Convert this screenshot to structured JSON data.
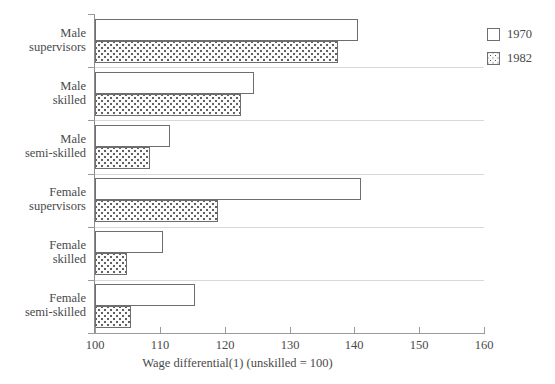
{
  "chart_data": {
    "type": "bar",
    "orientation": "horizontal",
    "title": "",
    "xlabel": "Wage differential(1) (unskilled = 100)",
    "ylabel": "",
    "xlim": [
      100,
      160
    ],
    "xticks": [
      100,
      110,
      120,
      130,
      140,
      150,
      160
    ],
    "xtick_labels": [
      "100",
      "110",
      "120",
      "130",
      "140",
      "150",
      "160"
    ],
    "grid": false,
    "legend_position": "right",
    "categories": [
      "Male\nsupervisors",
      "Male\nskilled",
      "Male\nsemi-skilled",
      "Female\nsupervisors",
      "Female\nskilled",
      "Female\nsemi-skilled"
    ],
    "series": [
      {
        "name": "1970",
        "values": [
          140.5,
          124.5,
          111.5,
          141.0,
          110.5,
          115.5
        ]
      },
      {
        "name": "1982",
        "values": [
          137.5,
          122.5,
          108.5,
          119.0,
          105.0,
          105.5
        ]
      }
    ]
  },
  "legend": {
    "items": [
      {
        "label": "1970",
        "pattern": "empty"
      },
      {
        "label": "1982",
        "pattern": "dotted"
      }
    ]
  },
  "axis": {
    "x_title": "Wage differential(1) (unskilled = 100)",
    "tick_labels": [
      "100",
      "110",
      "120",
      "130",
      "140",
      "150",
      "160"
    ]
  },
  "categories": [
    {
      "line1": "Male",
      "line2": "supervisors"
    },
    {
      "line1": "Male",
      "line2": "skilled"
    },
    {
      "line1": "Male",
      "line2": "semi-skilled"
    },
    {
      "line1": "Female",
      "line2": "supervisors"
    },
    {
      "line1": "Female",
      "line2": "skilled"
    },
    {
      "line1": "Female",
      "line2": "semi-skilled"
    }
  ],
  "colors": {
    "axis": "#8c8c8c",
    "bar_outline": "#6e6e6e",
    "text": "#4a4a4a",
    "background": "#ffffff"
  }
}
